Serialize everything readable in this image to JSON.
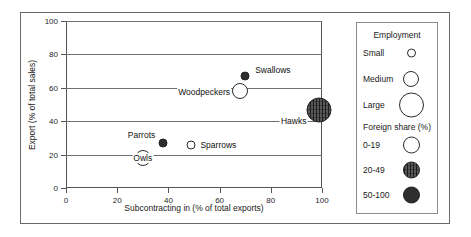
{
  "chart_data": {
    "type": "scatter",
    "title": "",
    "xlabel": "Subcontracting in (% of total exports)",
    "ylabel": "Export (% of total sales)",
    "xlim": [
      0,
      100
    ],
    "ylim": [
      0,
      100
    ],
    "xticks": [
      0,
      20,
      40,
      60,
      80,
      100
    ],
    "yticks": [
      0,
      20,
      40,
      60,
      80,
      100
    ],
    "grid": "horizontal",
    "legend_position": "right",
    "points": [
      {
        "label": "Swallows",
        "x": 70,
        "y": 67,
        "size": "Small",
        "foreign_share": "50-100"
      },
      {
        "label": "Woodpeckers",
        "x": 68,
        "y": 58,
        "size": "Medium",
        "foreign_share": "0-19"
      },
      {
        "label": "Hawks",
        "x": 99,
        "y": 47,
        "size": "Large",
        "foreign_share": "20-49"
      },
      {
        "label": "Parrots",
        "x": 38,
        "y": 27,
        "size": "Small",
        "foreign_share": "50-100"
      },
      {
        "label": "Sparrows",
        "x": 49,
        "y": 26,
        "size": "Small",
        "foreign_share": "0-19"
      },
      {
        "label": "Owls",
        "x": 30,
        "y": 18,
        "size": "Medium",
        "foreign_share": "0-19"
      }
    ]
  },
  "legend": {
    "size_title": "Employment",
    "sizes": [
      {
        "label": "Small",
        "diameter": 9
      },
      {
        "label": "Medium",
        "diameter": 16
      },
      {
        "label": "Large",
        "diameter": 25
      }
    ],
    "share_title": "Foreign share (%)",
    "shares": [
      {
        "label": "0-19",
        "fill": "open"
      },
      {
        "label": "20-49",
        "fill": "hatch"
      },
      {
        "label": "50-100",
        "fill": "solid"
      }
    ]
  },
  "colors": {
    "axis": "#555555",
    "grid": "#6e6e6e",
    "solid_fill": "#2e2e2e",
    "hatch_fill": "#585858",
    "open_fill": "#ffffff",
    "frame": "#6b6b6b"
  }
}
